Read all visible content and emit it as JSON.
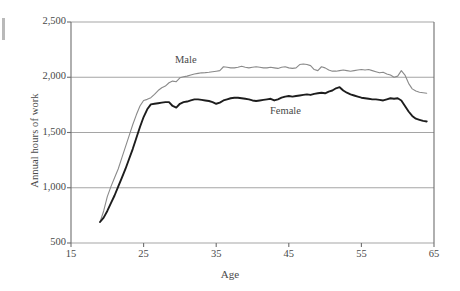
{
  "chart_data": {
    "type": "line",
    "title": "",
    "xlabel": "Age",
    "ylabel": "Annual hours of work",
    "xlim": [
      15,
      65
    ],
    "ylim": [
      500,
      2500
    ],
    "xticks": [
      15,
      25,
      35,
      45,
      55,
      65
    ],
    "xtick_labels": [
      "15",
      "25",
      "35",
      "45",
      "55",
      "65"
    ],
    "yticks": [
      500,
      1000,
      1500,
      2000,
      2500
    ],
    "ytick_labels": [
      "500",
      "1,000",
      "1,500",
      "2,000",
      "2,500"
    ],
    "grid": "horizontal",
    "legend_position": "inline-annotations",
    "series": [
      {
        "name": "Male",
        "color": "#8a8a8a",
        "label_text": "Male",
        "x": [
          19,
          19.5,
          20,
          20.5,
          21,
          21.5,
          22,
          22.5,
          23,
          23.5,
          24,
          24.5,
          25,
          25.5,
          26,
          26.5,
          27,
          27.5,
          28,
          28.5,
          29,
          29.5,
          30,
          30.5,
          31,
          31.5,
          32,
          32.5,
          33,
          33.5,
          34,
          34.5,
          35,
          35.5,
          36,
          36.5,
          37,
          37.5,
          38,
          38.5,
          39,
          39.5,
          40,
          40.5,
          41,
          41.5,
          42,
          42.5,
          43,
          43.5,
          44,
          44.5,
          45,
          45.5,
          46,
          46.5,
          47,
          47.5,
          48,
          48.5,
          49,
          49.5,
          50,
          50.5,
          51,
          51.5,
          52,
          52.5,
          53,
          53.5,
          54,
          54.5,
          55,
          55.5,
          56,
          56.5,
          57,
          57.5,
          58,
          58.5,
          59,
          59.5,
          60,
          60.5,
          61,
          61.5,
          62,
          62.5,
          63,
          63.5,
          64
        ],
        "y": [
          690,
          790,
          920,
          1010,
          1090,
          1170,
          1270,
          1370,
          1470,
          1570,
          1660,
          1740,
          1790,
          1800,
          1815,
          1845,
          1880,
          1905,
          1920,
          1950,
          1965,
          1960,
          1995,
          2005,
          2010,
          2020,
          2030,
          2035,
          2040,
          2042,
          2045,
          2050,
          2055,
          2060,
          2095,
          2090,
          2085,
          2085,
          2090,
          2100,
          2090,
          2085,
          2090,
          2095,
          2090,
          2085,
          2085,
          2090,
          2085,
          2080,
          2090,
          2095,
          2085,
          2080,
          2085,
          2115,
          2120,
          2115,
          2105,
          2070,
          2060,
          2095,
          2085,
          2065,
          2055,
          2055,
          2060,
          2065,
          2060,
          2055,
          2060,
          2065,
          2070,
          2065,
          2070,
          2060,
          2050,
          2040,
          2045,
          2030,
          2020,
          2000,
          2010,
          2060,
          2020,
          1945,
          1895,
          1875,
          1865,
          1860,
          1855
        ]
      },
      {
        "name": "Female",
        "color": "#1d1d1d",
        "label_text": "Female",
        "x": [
          19,
          19.5,
          20,
          20.5,
          21,
          21.5,
          22,
          22.5,
          23,
          23.5,
          24,
          24.5,
          25,
          25.5,
          26,
          26.5,
          27,
          27.5,
          28,
          28.5,
          29,
          29.5,
          30,
          30.5,
          31,
          31.5,
          32,
          32.5,
          33,
          33.5,
          34,
          34.5,
          35,
          35.5,
          36,
          36.5,
          37,
          37.5,
          38,
          38.5,
          39,
          39.5,
          40,
          40.5,
          41,
          41.5,
          42,
          42.5,
          43,
          43.5,
          44,
          44.5,
          45,
          45.5,
          46,
          46.5,
          47,
          47.5,
          48,
          48.5,
          49,
          49.5,
          50,
          50.5,
          51,
          51.5,
          52,
          52.5,
          53,
          53.5,
          54,
          54.5,
          55,
          55.5,
          56,
          56.5,
          57,
          57.5,
          58,
          58.5,
          59,
          59.5,
          60,
          60.5,
          61,
          61.5,
          62,
          62.5,
          63,
          63.5,
          64
        ],
        "y": [
          690,
          730,
          790,
          860,
          930,
          1010,
          1090,
          1170,
          1260,
          1350,
          1450,
          1550,
          1640,
          1710,
          1755,
          1760,
          1765,
          1770,
          1775,
          1775,
          1740,
          1725,
          1760,
          1775,
          1780,
          1790,
          1800,
          1800,
          1795,
          1790,
          1785,
          1775,
          1760,
          1770,
          1790,
          1800,
          1810,
          1815,
          1815,
          1810,
          1805,
          1800,
          1790,
          1785,
          1790,
          1795,
          1800,
          1805,
          1790,
          1800,
          1815,
          1825,
          1830,
          1825,
          1830,
          1835,
          1840,
          1845,
          1840,
          1850,
          1855,
          1860,
          1855,
          1870,
          1880,
          1900,
          1910,
          1880,
          1860,
          1845,
          1835,
          1825,
          1815,
          1810,
          1805,
          1800,
          1800,
          1795,
          1790,
          1800,
          1810,
          1805,
          1810,
          1790,
          1740,
          1690,
          1650,
          1625,
          1615,
          1605,
          1600
        ]
      }
    ]
  },
  "axis": {
    "x_title": "Age",
    "y_title": "Annual hours of work"
  }
}
